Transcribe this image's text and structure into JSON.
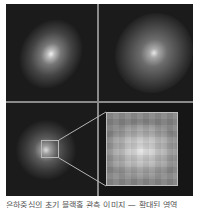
{
  "figure": {
    "panels": [
      {
        "id": "top-left",
        "description": "galaxy image, bright compact core, elongated diagonal glow"
      },
      {
        "id": "top-right",
        "description": "galaxy image, diffuse core"
      },
      {
        "id": "bottom-left",
        "description": "galaxy image with highlighted inset region"
      },
      {
        "id": "bottom-right",
        "description": "pixelated zoomed inset of the highlighted region"
      }
    ],
    "colors": {
      "background": "#1b1b1b",
      "divider": "#8a8a8a",
      "inset_border": "#bdbdbd"
    }
  },
  "caption": {
    "text": "은하중심의 초기 블랙홀 관측 이미지 — 확대된 영역"
  }
}
